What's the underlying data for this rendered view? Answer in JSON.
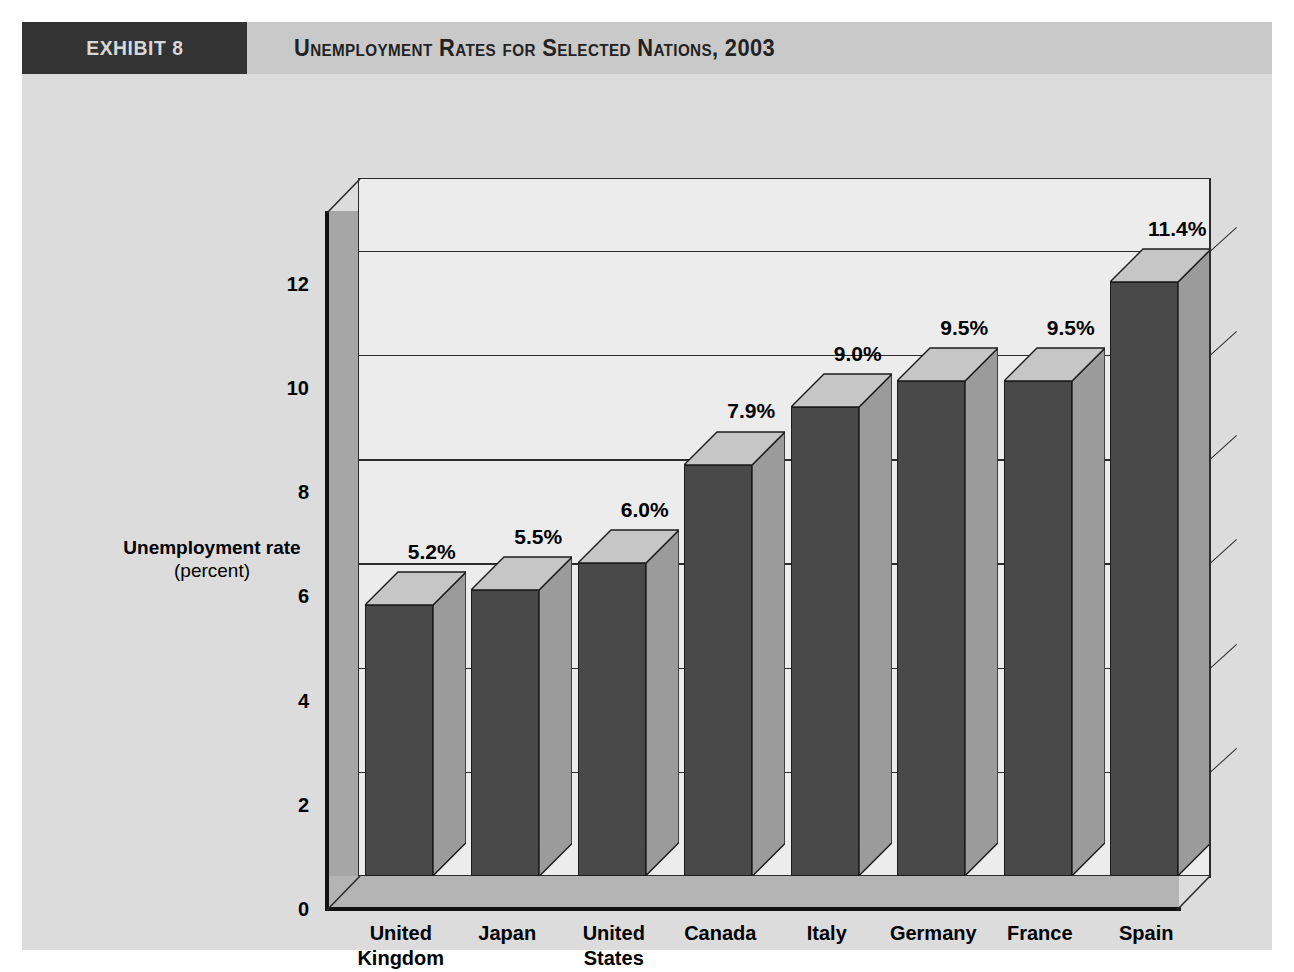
{
  "exhibit": {
    "tag": "EXHIBIT 8",
    "title": "Unemployment Rates for Selected Nations, 2003"
  },
  "chart_data": {
    "type": "bar",
    "title": "Unemployment Rates for Selected Nations, 2003",
    "xlabel": "Country",
    "ylabel": "Unemployment rate",
    "ylabel_unit": "(percent)",
    "ylim": [
      0,
      13.4
    ],
    "yticks": [
      0,
      2,
      4,
      6,
      8,
      10,
      12
    ],
    "ytick_labels": [
      "0",
      "2",
      "4",
      "6",
      "8",
      "10",
      "12"
    ],
    "grid": true,
    "legend": null,
    "categories": [
      "United Kingdom",
      "Japan",
      "United States",
      "Canada",
      "Italy",
      "Germany",
      "France",
      "Spain"
    ],
    "category_lines": [
      [
        "United",
        "Kingdom"
      ],
      [
        "Japan",
        ""
      ],
      [
        "United",
        "States"
      ],
      [
        "Canada",
        ""
      ],
      [
        "Italy",
        ""
      ],
      [
        "Germany",
        ""
      ],
      [
        "France",
        ""
      ],
      [
        "Spain",
        ""
      ]
    ],
    "values": [
      5.2,
      5.5,
      6.0,
      7.9,
      9.0,
      9.5,
      9.5,
      11.4
    ],
    "data_labels": [
      "5.2%",
      "5.5%",
      "6.0%",
      "7.9%",
      "9.0%",
      "9.5%",
      "9.5%",
      "11.4%"
    ]
  },
  "colors": {
    "panel_background": "#dcdcdc",
    "header_band": "#c9c9c9",
    "exhibit_tag_background": "#333333",
    "exhibit_tag_text": "#d8d8d8",
    "plot_back_wall": "#ececec",
    "plot_side_wall": "#a6a6a6",
    "plot_floor": "#b4b4b4",
    "bar_front": "#494949",
    "bar_side": "#9b9b9b",
    "bar_top": "#c6c6c6",
    "axis_line": "#111111",
    "gridline": "#2b2b2b",
    "text": "#000000"
  }
}
